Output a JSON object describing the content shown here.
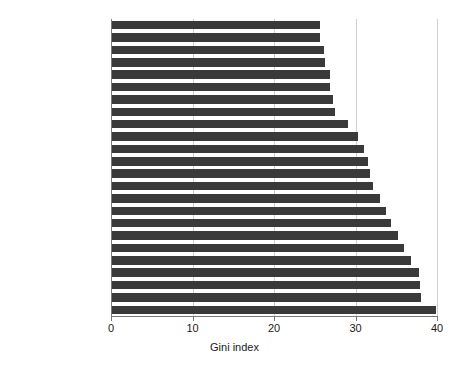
{
  "chart_data": {
    "type": "bar",
    "orientation": "horizontal",
    "title": "",
    "xlabel": "Gini index",
    "ylabel": "",
    "xlim": [
      0,
      40
    ],
    "xticks": [
      "0",
      "10",
      "20",
      "30",
      "40"
    ],
    "xtick_values": [
      0,
      10,
      20,
      30,
      40
    ],
    "grid": "vertical",
    "legend": "none",
    "bar_color": "#3a3a3a",
    "grid_color": "#cfcfcf",
    "axis_color": "#7a7a7a",
    "categories": [
      "Slovenia",
      "Ukraine",
      "Belarus",
      "Czech Republic",
      "Kosovo",
      "Slovak Republic",
      "Kazakhstan",
      "Moldova",
      "Kyrgyz Republic",
      "Hungary",
      "Croatia",
      "Poland",
      "Montenegro",
      "Armenia",
      "Estonia",
      "Tajikistan",
      "Latvia",
      "North Macedonia",
      "Romania",
      "Georgia",
      "Bulgaria",
      "Lithuania",
      "Russian Federation",
      "Serbia"
    ],
    "values": [
      25.6,
      25.6,
      26.1,
      26.2,
      26.9,
      26.9,
      27.2,
      27.5,
      29.1,
      30.3,
      31.0,
      31.5,
      31.8,
      32.1,
      33.0,
      33.7,
      34.4,
      35.2,
      35.9,
      36.8,
      37.8,
      37.9,
      38.0,
      39.9
    ]
  }
}
